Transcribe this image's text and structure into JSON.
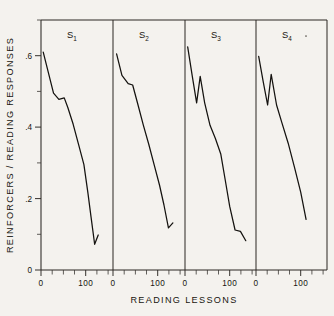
{
  "chart_data": {
    "type": "line",
    "title": "",
    "xlabel": "READING LESSONS",
    "ylabel": "REINFORCERS / READING RESPONSES",
    "ylim": [
      0,
      0.7
    ],
    "xlim": [
      0,
      160
    ],
    "grid": false,
    "legend": "none",
    "layout": "4 side-by-side panels sharing one y-axis",
    "ytick_labels": [
      "0",
      ".2",
      ".4",
      ".6"
    ],
    "ytick_values": [
      0,
      0.2,
      0.4,
      0.6
    ],
    "yminor_values": [
      0.1,
      0.3,
      0.5,
      0.7
    ],
    "xtick_labels": [
      "0",
      "100"
    ],
    "xtick_values": [
      0,
      100
    ],
    "xminor_values": [
      25,
      50,
      75,
      125,
      150
    ],
    "panels": [
      {
        "name": "S1",
        "label": "S",
        "subscript": "1",
        "x": [
          5,
          12,
          28,
          40,
          52,
          60,
          72,
          84,
          96,
          105,
          112,
          120,
          128
        ],
        "y": [
          0.61,
          0.575,
          0.495,
          0.478,
          0.482,
          0.455,
          0.408,
          0.352,
          0.295,
          0.215,
          0.148,
          0.072,
          0.098
        ]
      },
      {
        "name": "S2",
        "label": "S",
        "subscript": "2",
        "x": [
          8,
          20,
          34,
          44,
          56,
          68,
          80,
          92,
          104,
          114,
          124,
          134
        ],
        "y": [
          0.605,
          0.545,
          0.522,
          0.518,
          0.462,
          0.405,
          0.352,
          0.295,
          0.238,
          0.182,
          0.118,
          0.132
        ]
      },
      {
        "name": "S3",
        "label": "S",
        "subscript": "3",
        "x": [
          6,
          16,
          26,
          34,
          44,
          56,
          68,
          80,
          90,
          100,
          112,
          124,
          136
        ],
        "y": [
          0.625,
          0.545,
          0.468,
          0.542,
          0.468,
          0.405,
          0.368,
          0.325,
          0.252,
          0.178,
          0.112,
          0.108,
          0.082
        ]
      },
      {
        "name": "S4",
        "label": "S",
        "subscript": "4",
        "x": [
          6,
          16,
          26,
          34,
          46,
          58,
          72,
          86,
          100,
          112
        ],
        "y": [
          0.598,
          0.528,
          0.462,
          0.548,
          0.462,
          0.412,
          0.355,
          0.288,
          0.218,
          0.142
        ]
      }
    ]
  }
}
